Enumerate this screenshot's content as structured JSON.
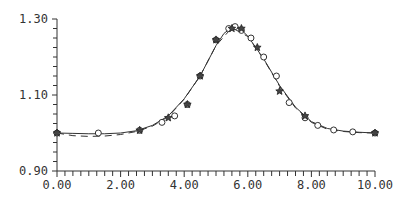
{
  "chart_data": {
    "type": "line",
    "title": "",
    "xlabel": "",
    "ylabel": "",
    "xlim": [
      0,
      10
    ],
    "ylim": [
      0.9,
      1.3
    ],
    "x_ticks": [
      "0.00",
      "2.00",
      "4.00",
      "6.00",
      "8.00",
      "10.00"
    ],
    "y_ticks": [
      "0.90",
      "1.10",
      "1.30"
    ],
    "grid": false,
    "legend": null,
    "series": [
      {
        "name": "solid curve",
        "style": "solid",
        "x": [
          0,
          0.5,
          1,
          1.5,
          2,
          2.5,
          3,
          3.5,
          4,
          4.5,
          5,
          5.25,
          5.5,
          5.75,
          6,
          6.5,
          7,
          7.5,
          8,
          8.5,
          9,
          9.5,
          10
        ],
        "y": [
          1.0,
          0.999,
          0.998,
          0.998,
          1.0,
          1.006,
          1.02,
          1.045,
          1.09,
          1.15,
          1.23,
          1.262,
          1.278,
          1.275,
          1.255,
          1.195,
          1.125,
          1.068,
          1.03,
          1.012,
          1.005,
          1.002,
          1.0
        ]
      },
      {
        "name": "dashed curve",
        "style": "dashed",
        "x": [
          0,
          0.5,
          1,
          1.5,
          2,
          2.5,
          3,
          3.5,
          4,
          4.5,
          5,
          5.5,
          6,
          6.5,
          7,
          7.5,
          8,
          8.5,
          9,
          9.5,
          10
        ],
        "y": [
          1.0,
          0.993,
          0.991,
          0.992,
          0.996,
          1.004,
          1.018,
          1.043,
          1.089,
          1.15,
          1.23,
          1.277,
          1.254,
          1.194,
          1.123,
          1.066,
          1.028,
          1.01,
          1.004,
          1.001,
          1.0
        ]
      },
      {
        "name": "circle markers",
        "marker": "circle",
        "x": [
          0,
          1.3,
          2.6,
          3.3,
          3.7,
          4.1,
          4.5,
          5.0,
          5.4,
          5.6,
          5.8,
          6.1,
          6.5,
          6.9,
          7.3,
          7.8,
          8.2,
          8.7,
          9.3,
          10.0
        ],
        "y": [
          1.0,
          1.0,
          1.007,
          1.028,
          1.045,
          1.075,
          1.15,
          1.245,
          1.275,
          1.28,
          1.27,
          1.25,
          1.2,
          1.15,
          1.08,
          1.04,
          1.02,
          1.008,
          1.003,
          1.0
        ]
      },
      {
        "name": "star markers",
        "marker": "star",
        "x": [
          0,
          2.6,
          3.5,
          4.1,
          4.5,
          5.0,
          5.5,
          5.8,
          6.3,
          7.0,
          7.8,
          10.0
        ],
        "y": [
          1.0,
          1.007,
          1.04,
          1.075,
          1.15,
          1.245,
          1.275,
          1.275,
          1.225,
          1.11,
          1.045,
          1.0
        ]
      }
    ]
  }
}
